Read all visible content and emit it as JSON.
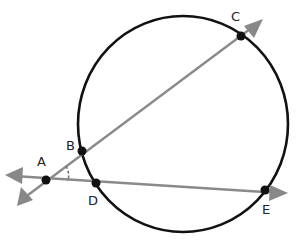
{
  "diagram": {
    "type": "circle-with-secants",
    "colors": {
      "circle": "#111111",
      "lines": "#8a8a8a",
      "points": "#111111",
      "angle_mark": "#777777"
    },
    "circle": {
      "cx": 183,
      "cy": 124,
      "rx": 105,
      "ry": 108
    },
    "points": [
      {
        "id": "A",
        "label": "A",
        "x": 46,
        "y": 180,
        "lx": 37,
        "ly": 166
      },
      {
        "id": "B",
        "label": "B",
        "x": 82,
        "y": 151,
        "lx": 66,
        "ly": 150
      },
      {
        "id": "C",
        "label": "C",
        "x": 241,
        "y": 36,
        "lx": 232,
        "ly": 20
      },
      {
        "id": "D",
        "label": "D",
        "x": 96,
        "y": 183,
        "lx": 88,
        "ly": 204
      },
      {
        "id": "E",
        "label": "E",
        "x": 265,
        "y": 190,
        "lx": 263,
        "ly": 214
      }
    ],
    "rays": [
      {
        "name": "ray-ABC",
        "through": [
          "A",
          "B",
          "C"
        ]
      },
      {
        "name": "line-ADE",
        "through": [
          "A",
          "D",
          "E"
        ]
      }
    ],
    "angle_marked": "BAD"
  }
}
